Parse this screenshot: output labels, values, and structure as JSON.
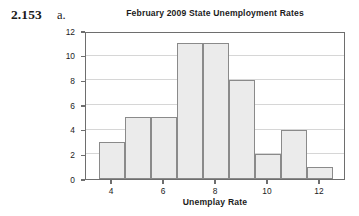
{
  "exercise": {
    "number": "2.153",
    "part": "a."
  },
  "chart_data": {
    "type": "bar",
    "title": "February 2009 State Unemployment Rates",
    "xlabel": "Unemplay Rate",
    "ylabel": "Frequency",
    "bin_width": 1,
    "bin_edges": [
      3.5,
      4.5,
      5.5,
      6.5,
      7.5,
      8.5,
      9.5,
      10.5,
      11.5,
      12.5
    ],
    "categories": [
      "3.5-4.5",
      "4.5-5.5",
      "5.5-6.5",
      "6.5-7.5",
      "7.5-8.5",
      "8.5-9.5",
      "9.5-10.5",
      "10.5-11.5",
      "11.5-12.5"
    ],
    "bin_centers": [
      4,
      5,
      6,
      7,
      8,
      9,
      10,
      11,
      12
    ],
    "values": [
      3,
      5,
      5,
      11,
      11,
      8,
      2,
      4,
      1
    ],
    "xlim": [
      3,
      13
    ],
    "ylim": [
      0,
      12
    ],
    "xticks": [
      4,
      6,
      8,
      10,
      12
    ],
    "xtick_labels": [
      "4",
      "6",
      "8",
      "10",
      "12"
    ],
    "yticks": [
      0,
      2,
      4,
      6,
      8,
      10,
      12
    ],
    "ytick_labels": [
      "0",
      "2",
      "4",
      "6",
      "8",
      "10",
      "12"
    ],
    "grid": "horizontal",
    "legend": null,
    "bar_fill_color": "#ebebeb",
    "bar_edge_color": "#8a8a8a",
    "frame_color": "#6e6e6e",
    "gridline_color": "#d6d6d6",
    "background_color": "#ffffff"
  }
}
